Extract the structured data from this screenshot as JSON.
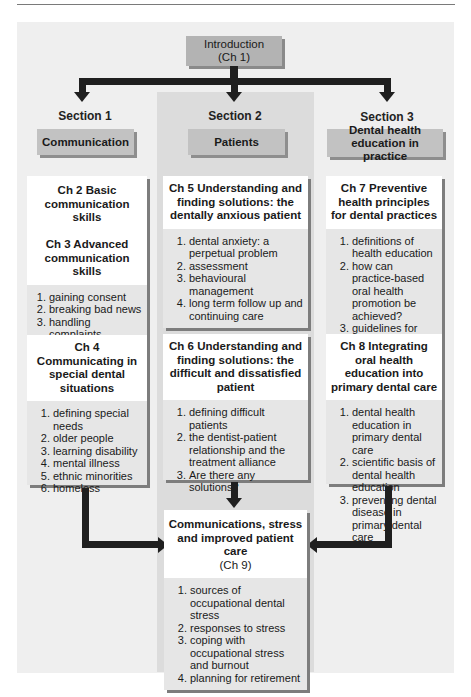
{
  "intro": {
    "title": "Introduction",
    "chapter": "(Ch 1)"
  },
  "sections": [
    {
      "label": "Section 1",
      "name": "Communication"
    },
    {
      "label": "Section 2",
      "name": "Patients"
    },
    {
      "label": "Section 3",
      "name": "Dental health education in practice"
    }
  ],
  "chapters": {
    "ch2": {
      "title": "Ch 2 Basic communication skills"
    },
    "ch3": {
      "title": "Ch 3 Advanced communication skills",
      "items": [
        "gaining consent",
        "breaking bad news",
        "handling complaints"
      ]
    },
    "ch4": {
      "title": "Ch 4 Communicating in special dental situations",
      "items": [
        "defining special needs",
        "older people",
        "learning disability",
        "mental illness",
        "ethnic minorities",
        "homeless"
      ]
    },
    "ch5": {
      "title": "Ch 5 Understanding and finding solutions: the dentally anxious patient",
      "items": [
        "dental anxiety: a perpetual problem",
        "assessment",
        "behavioural management",
        "long term follow up and continuing care"
      ]
    },
    "ch6": {
      "title": "Ch 6 Understanding and finding solutions: the difficult and dissatisfied patient",
      "items": [
        "defining difficult patients",
        "the dentist-patient relationship and the treatment alliance",
        "Are there any solutions?"
      ]
    },
    "ch7": {
      "title": "Ch 7 Preventive health principles for dental practices",
      "items": [
        "definitions of health education",
        "how can practice-based oral health promotion be achieved?",
        "guidelines for best practice"
      ]
    },
    "ch8": {
      "title": "Ch 8 Integrating oral health education into primary dental care",
      "items": [
        "dental health education in primary dental care",
        "scientific basis of dental health education",
        "preventing dental disease in primary dental care"
      ]
    },
    "ch9": {
      "title": "Communications, stress and improved patient care",
      "chapter": "(Ch 9)",
      "items": [
        "sources of occupational dental stress",
        "responses to stress",
        "coping with occupational stress and burnout",
        "planning for retirement"
      ]
    }
  },
  "colors": {
    "panel": "#efefef",
    "center_column": "#dcdcdc",
    "header_box": "#c2c2c2",
    "arrow": "#1f1f1f"
  }
}
